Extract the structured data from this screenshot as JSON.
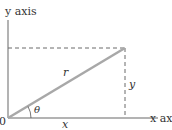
{
  "diagram": {
    "type": "polar-coordinates-right-triangle",
    "labels": {
      "y_axis": "y axis",
      "x_axis": "x axi",
      "origin": "0",
      "hypotenuse": "r",
      "angle": "θ",
      "horizontal_leg": "x",
      "vertical_leg": "y"
    },
    "colors": {
      "axis": "#9a9a9a",
      "hypotenuse": "#a8a8a8",
      "dashed": "#6a6a6a",
      "text": "#333333"
    }
  }
}
